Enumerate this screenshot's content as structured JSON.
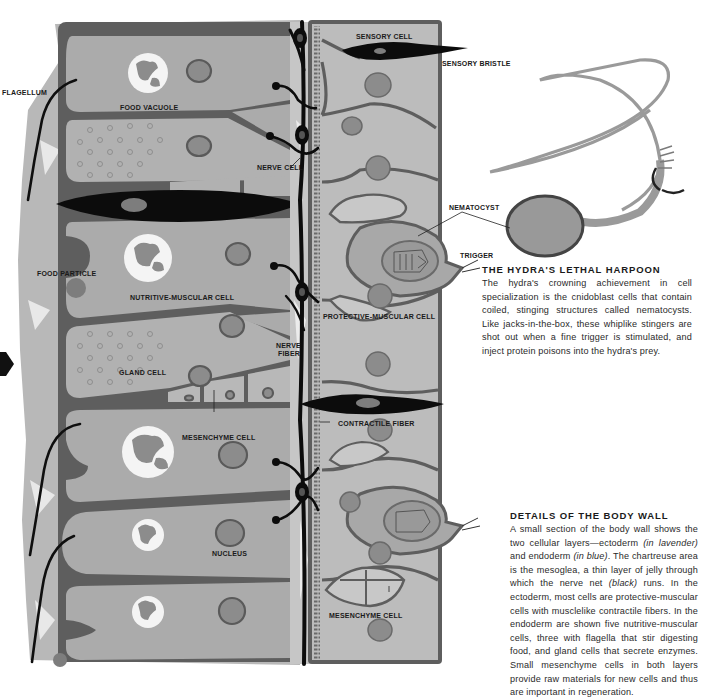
{
  "figure": {
    "palette": {
      "endoderm_cell": "#aaaaaa",
      "ectoderm_cell": "#b9b9b9",
      "cell_wall": "#5e5e5e",
      "mesoglea": "#c9c9c9",
      "nerve_net": "#0d0d0d",
      "nucleus": "#8a8a8a",
      "food_vacuole": "#f2f2f2",
      "background": "#ffffff"
    },
    "labels": {
      "flagellum": "FLAGELLUM",
      "food_vacuole": "FOOD VACUOLE",
      "sensory_cell": "SENSORY CELL",
      "sensory_bristle": "SENSORY BRISTLE",
      "nerve_cell": "NERVE CELL",
      "nematocyst": "NEMATOCYST",
      "trigger": "TRIGGER",
      "food_particle": "FOOD PARTICLE",
      "nutritive_muscular_cell": "NUTRITIVE-MUSCULAR CELL",
      "protective_muscular_cell": "PROTECTIVE-MUSCULAR CELL",
      "nerve_fiber_line1": "NERVE",
      "nerve_fiber_line2": "FIBER",
      "gland_cell": "GLAND CELL",
      "contractile_fiber": "CONTRACTILE FIBER",
      "mesenchyme_cell_left": "MESENCHYME CELL",
      "nucleus": "NUCLEUS",
      "mesenchyme_cell_right": "MESENCHYME CELL"
    }
  },
  "sections": {
    "harpoon": {
      "title": "THE HYDRA'S LETHAL HARPOON",
      "body": "The hydra's crowning achievement in cell specialization is the cnidoblast cells that contain coiled, stinging structures called nematocysts. Like jacks-in-the-box, these whiplike stingers are shot out when a fine trigger is stimulated, and inject protein poisons into the hydra's prey."
    },
    "body_wall": {
      "title": "DETAILS OF THE BODY WALL",
      "body_part1": "A small section of the body wall shows the two cellular layers—ectoderm ",
      "ectoderm_color": "(in lavender)",
      "body_part2": " and endoderm ",
      "endoderm_color": "(in blue)",
      "body_part3": ". The chartreuse area is the mesoglea, a thin layer of jelly through which the nerve net ",
      "nerve_color": "(black)",
      "body_part4": " runs. In the ectoderm, most cells are protective-muscular cells with musclelike contractile fibers. In the endoderm are shown five nutritive-muscular cells, three with flagella that stir digesting food, and gland cells that secrete enzymes. Small mesenchyme cells in both layers provide raw materials for new cells and thus are important in regeneration."
    }
  }
}
